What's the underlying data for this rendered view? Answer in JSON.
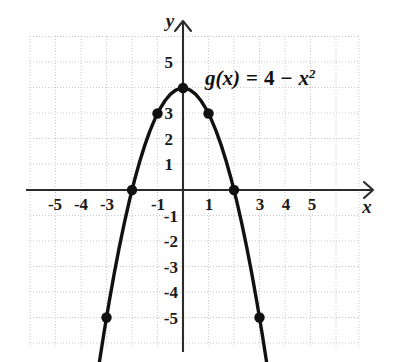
{
  "figure": {
    "kind": "cartesian-plot",
    "background": "#ffffff",
    "grid_color": "#c9c9c9",
    "axis_color": "#2b2b2b",
    "curve_color": "#111111",
    "point_color": "#111111"
  },
  "axes": {
    "x_axis_label": "x",
    "y_axis_label": "y",
    "x_tick_labels": [
      "-5",
      "-4",
      "-3",
      "-1",
      "1",
      "3",
      "4",
      "5"
    ],
    "y_tick_labels": [
      "5",
      "3",
      "2",
      "1",
      "-1",
      "-2",
      "-3",
      "-4",
      "-5"
    ],
    "x_label_minus5": "-5",
    "x_label_minus4": "-4",
    "x_label_minus3": "-3",
    "x_label_minus1": "-1",
    "x_label_1": "1",
    "x_label_3": "3",
    "x_label_4": "4",
    "x_label_5": "5",
    "y_label_5": "5",
    "y_label_3": "3",
    "y_label_2": "2",
    "y_label_1": "1",
    "y_label_minus1": "-1",
    "y_label_minus2": "-2",
    "y_label_minus3": "-3",
    "y_label_minus4": "-4",
    "y_label_minus5": "-5"
  },
  "annotation": {
    "function_name": "g",
    "variable_open": "(x)",
    "equals": "=",
    "constant": "4",
    "minus": "−",
    "term_base": "x",
    "term_exponent": "2",
    "full_text": "g(x) = 4 − x²"
  },
  "chart_data": {
    "type": "line",
    "title": "",
    "subtitle": "",
    "xlabel": "x",
    "ylabel": "y",
    "xlim": [
      -6,
      6.2
    ],
    "ylim": [
      -6.2,
      5.9
    ],
    "grid": true,
    "grid_step": 1,
    "legend": "none",
    "annotations": [
      {
        "text": "g(x) = 4 − x²",
        "x": 1.4,
        "y": 4.7
      }
    ],
    "series": [
      {
        "name": "g(x) = 4 - x^2",
        "equation": "g(x) = 4 - x^2",
        "kind": "parabola",
        "vertex": [
          0,
          4
        ],
        "opens": "down",
        "roots": [
          -2,
          2
        ],
        "x": [
          -3.28,
          -3.1,
          -2.9,
          -2.7,
          -2.5,
          -2.3,
          -2.1,
          -1.9,
          -1.7,
          -1.5,
          -1.3,
          -1.1,
          -0.9,
          -0.7,
          -0.5,
          -0.3,
          -0.1,
          0.1,
          0.3,
          0.5,
          0.7,
          0.9,
          1.1,
          1.3,
          1.5,
          1.7,
          1.9,
          2.1,
          2.3,
          2.5,
          2.7,
          2.9,
          3.1,
          3.28
        ],
        "y": [
          -6.76,
          -5.61,
          -4.41,
          -3.29,
          -2.25,
          -1.29,
          -0.41,
          0.39,
          1.11,
          1.75,
          2.31,
          2.79,
          3.19,
          3.51,
          3.75,
          3.91,
          3.99,
          3.99,
          3.91,
          3.75,
          3.51,
          3.19,
          2.79,
          2.31,
          1.75,
          1.11,
          0.39,
          -0.41,
          -1.29,
          -2.25,
          -3.29,
          -4.41,
          -5.61,
          -6.76
        ]
      }
    ],
    "marked_points": [
      {
        "x": -3,
        "y": -5,
        "label": "(-3, -5)"
      },
      {
        "x": -2,
        "y": 0,
        "label": "(-2, 0)"
      },
      {
        "x": -1,
        "y": 3,
        "label": "(-1, 3)"
      },
      {
        "x": 0,
        "y": 4,
        "label": "(0, 4)"
      },
      {
        "x": 1,
        "y": 3,
        "label": "(1, 3)"
      },
      {
        "x": 2,
        "y": 0,
        "label": "(2, 0)"
      },
      {
        "x": 3,
        "y": -5,
        "label": "(3, -5)"
      }
    ]
  }
}
